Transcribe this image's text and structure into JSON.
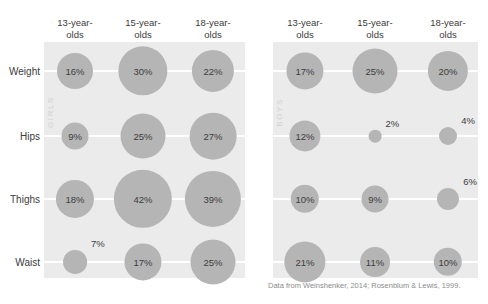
{
  "caption": "Data from Weinshenker, 2014; Rosenblum & Lewis, 1999.",
  "top_clipped_text": "",
  "panels": [
    {
      "key": "girls",
      "label": "GIRLS"
    },
    {
      "key": "boys",
      "label": "BOYS"
    }
  ],
  "columns": [
    {
      "line1": "13-year-",
      "line2": "olds"
    },
    {
      "line1": "15-year-",
      "line2": "olds"
    },
    {
      "line1": "18-year-",
      "line2": "olds"
    }
  ],
  "rows": [
    "Weight",
    "Hips",
    "Thighs",
    "Waist"
  ],
  "colors": {
    "panel_background": "#ebebeb",
    "bubble": "#b5b5b5",
    "row_line": "#ffffff",
    "text": "#3b3b3b",
    "group_label": "#d2d2d2",
    "caption": "#8c8c8c"
  },
  "chart_data": {
    "type": "bubble",
    "title": "",
    "xlabel": "",
    "ylabel": "",
    "value_unit": "percent",
    "categories": [
      "13-year-olds",
      "15-year-olds",
      "18-year-olds"
    ],
    "rows": [
      "Weight",
      "Hips",
      "Thighs",
      "Waist"
    ],
    "series": [
      {
        "name": "GIRLS",
        "cells": [
          {
            "row": "Weight",
            "category": "13-year-olds",
            "value": 16,
            "label": "16%"
          },
          {
            "row": "Weight",
            "category": "15-year-olds",
            "value": 30,
            "label": "30%"
          },
          {
            "row": "Weight",
            "category": "18-year-olds",
            "value": 22,
            "label": "22%"
          },
          {
            "row": "Hips",
            "category": "13-year-olds",
            "value": 9,
            "label": "9%"
          },
          {
            "row": "Hips",
            "category": "15-year-olds",
            "value": 25,
            "label": "25%"
          },
          {
            "row": "Hips",
            "category": "18-year-olds",
            "value": 27,
            "label": "27%"
          },
          {
            "row": "Thighs",
            "category": "13-year-olds",
            "value": 18,
            "label": "18%"
          },
          {
            "row": "Thighs",
            "category": "15-year-olds",
            "value": 42,
            "label": "42%"
          },
          {
            "row": "Thighs",
            "category": "18-year-olds",
            "value": 39,
            "label": "39%"
          },
          {
            "row": "Waist",
            "category": "13-year-olds",
            "value": 7,
            "label": "7%"
          },
          {
            "row": "Waist",
            "category": "15-year-olds",
            "value": 17,
            "label": "17%"
          },
          {
            "row": "Waist",
            "category": "18-year-olds",
            "value": 25,
            "label": "25%"
          }
        ]
      },
      {
        "name": "BOYS",
        "cells": [
          {
            "row": "Weight",
            "category": "13-year-olds",
            "value": 17,
            "label": "17%"
          },
          {
            "row": "Weight",
            "category": "15-year-olds",
            "value": 25,
            "label": "25%"
          },
          {
            "row": "Weight",
            "category": "18-year-olds",
            "value": 20,
            "label": "20%"
          },
          {
            "row": "Hips",
            "category": "13-year-olds",
            "value": 12,
            "label": "12%"
          },
          {
            "row": "Hips",
            "category": "15-year-olds",
            "value": 2,
            "label": "2%"
          },
          {
            "row": "Hips",
            "category": "18-year-olds",
            "value": 4,
            "label": "4%"
          },
          {
            "row": "Thighs",
            "category": "13-year-olds",
            "value": 10,
            "label": "10%"
          },
          {
            "row": "Thighs",
            "category": "15-year-olds",
            "value": 9,
            "label": "9%"
          },
          {
            "row": "Thighs",
            "category": "18-year-olds",
            "value": 6,
            "label": "6%"
          },
          {
            "row": "Waist",
            "category": "13-year-olds",
            "value": 21,
            "label": "21%"
          },
          {
            "row": "Waist",
            "category": "15-year-olds",
            "value": 11,
            "label": "11%"
          },
          {
            "row": "Waist",
            "category": "18-year-olds",
            "value": 10,
            "label": "10%"
          }
        ]
      }
    ]
  }
}
